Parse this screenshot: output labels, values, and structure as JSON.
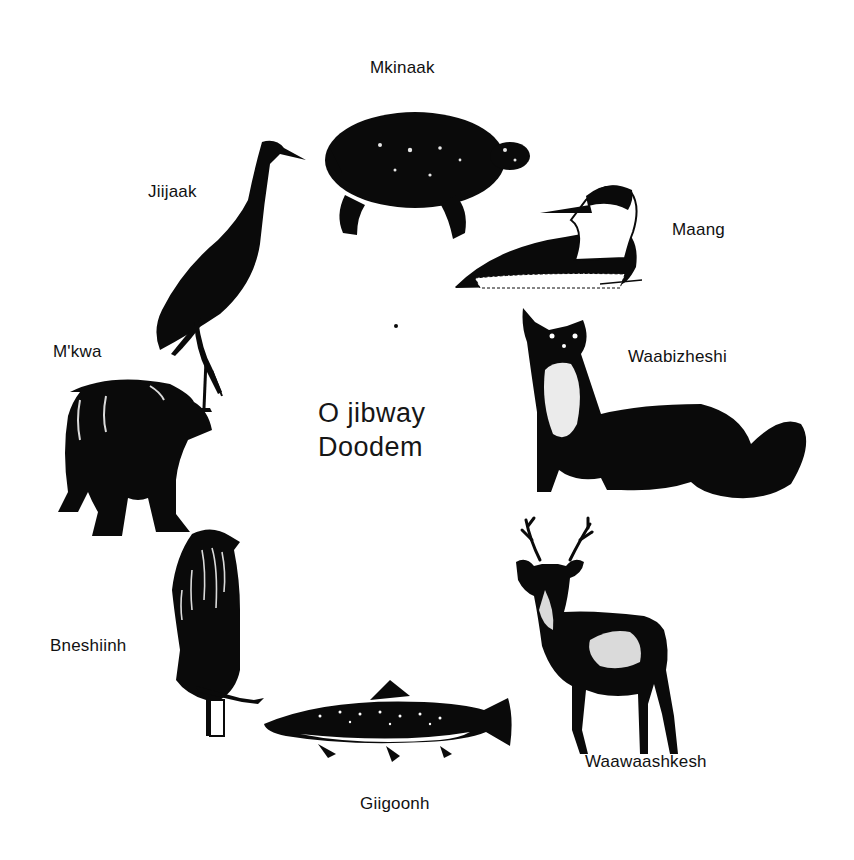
{
  "title": {
    "line1": "O jibway",
    "line2": "Doodem"
  },
  "clans": [
    {
      "name": "Mkinaak",
      "animal": "turtle-icon"
    },
    {
      "name": "Maang",
      "animal": "loon-icon"
    },
    {
      "name": "Waabizheshi",
      "animal": "marten-icon"
    },
    {
      "name": "Waawaashkesh",
      "animal": "deer-icon"
    },
    {
      "name": "Giigoonh",
      "animal": "fish-icon"
    },
    {
      "name": "Bneshiinh",
      "animal": "eagle-icon"
    },
    {
      "name": "M'kwa",
      "animal": "bear-icon"
    },
    {
      "name": "Jiijaak",
      "animal": "crane-icon"
    }
  ],
  "colors": {
    "ink": "#0a0a0a",
    "paper": "#ffffff"
  }
}
